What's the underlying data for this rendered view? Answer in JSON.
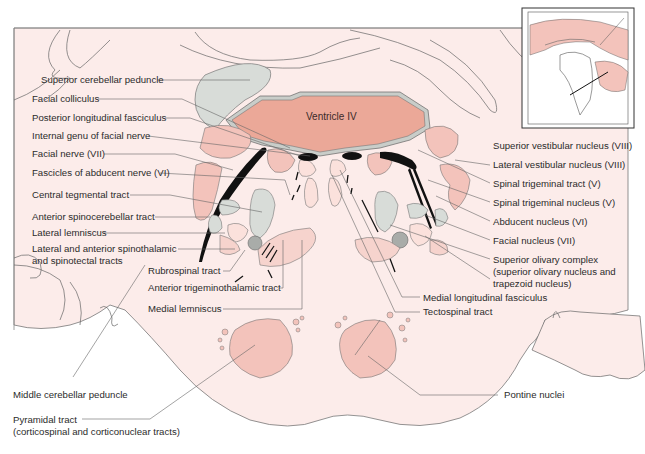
{
  "figure": {
    "colors": {
      "background_tissue": "#fcecea",
      "ventricle": "#eba898",
      "nucleus_pink": "#f3c3bb",
      "gray_tract": "#d8dcd8",
      "dark_gray": "#a9aca9",
      "fiber_black": "#111111",
      "outline": "#555555",
      "leader_line": "#666666"
    },
    "central_label": "Ventricle IV",
    "labels_left": [
      "Superior cerebellar peduncle",
      "Facial colliculus",
      "Posterior longitudinal fasciculus",
      "Internal genu of facial nerve",
      "Facial nerve (VII)",
      "Fascicles of abducent nerve (VI)",
      "Central tegmental tract",
      "Anterior spinocerebellar tract",
      "Lateral lemniscus",
      "Lateral and anterior spinothalamic\nand spinotectal tracts",
      "Middle cerebellar peduncle",
      "Pyramidal tract\n(corticospinal and corticonuclear tracts)"
    ],
    "labels_middle": [
      "Rubrospinal tract",
      "Anterior trigeminothalamic tract",
      "Medial lemniscus"
    ],
    "labels_right": [
      "Superior vestibular nucleus (VIII)",
      "Lateral vestibular nucleus (VIII)",
      "Spinal trigeminal tract (V)",
      "Spinal trigeminal nucleus (V)",
      "Abducent nucleus (VI)",
      "Facial nucleus (VII)",
      "Superior olivary complex\n(superior olivary nucleus and\ntrapezoid nucleus)",
      "Medial longitudinal fasciculus",
      "Tectospinal tract",
      "Pontine nuclei"
    ],
    "inset": {
      "description": "Mid-sagittal brain view with section plane line through the pons"
    }
  }
}
